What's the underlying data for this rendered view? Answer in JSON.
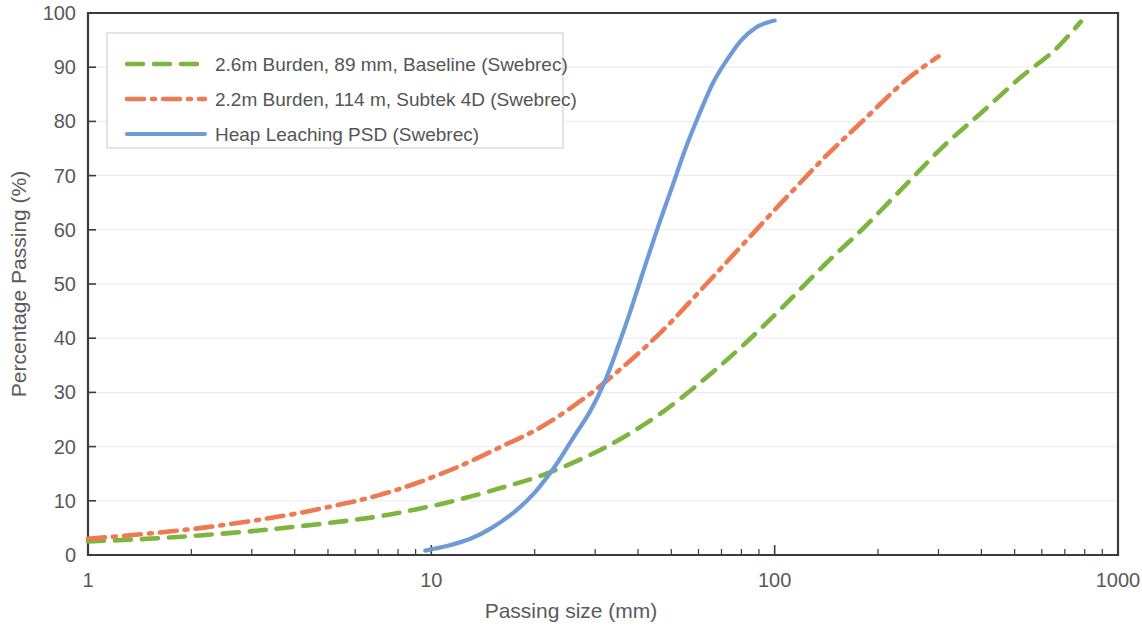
{
  "chart_data": {
    "type": "line",
    "title": "",
    "xlabel": "Passing size (mm)",
    "ylabel": "Percentage Passing (%)",
    "xscale": "log",
    "xlim": [
      1,
      1000
    ],
    "ylim": [
      0,
      100
    ],
    "xticks": [
      1,
      10,
      100,
      1000
    ],
    "xtick_labels": [
      "1",
      "10",
      "100",
      "1000"
    ],
    "yticks": [
      0,
      10,
      20,
      30,
      40,
      50,
      60,
      70,
      80,
      90,
      100
    ],
    "ytick_labels": [
      "0",
      "10",
      "20",
      "30",
      "40",
      "50",
      "60",
      "70",
      "80",
      "90",
      "100"
    ],
    "grid": "horizontal-faint",
    "legend_position": "upper-left",
    "series": [
      {
        "name": "2.6m Burden, 89 mm, Baseline (Swebrec)",
        "color": "#7EB53F",
        "style": "dashed",
        "dasharray": "16 11",
        "width": 4.6,
        "x": [
          1,
          1.3,
          1.7,
          2.2,
          3,
          4,
          5.5,
          7,
          9,
          12,
          16,
          21,
          28,
          36,
          47,
          62,
          80,
          105,
          140,
          180,
          240,
          310,
          400,
          520,
          650,
          780
        ],
        "y": [
          2.5,
          2.8,
          3.2,
          3.7,
          4.4,
          5.2,
          6.2,
          7.1,
          8.4,
          10.2,
          12.4,
          14.7,
          18.0,
          21.6,
          26.3,
          32.3,
          38.4,
          45.6,
          53.6,
          60.1,
          68.2,
          75.4,
          81.6,
          88.1,
          93.0,
          98.4
        ]
      },
      {
        "name": "2.2m Burden, 114 m, Subtek 4D (Swebrec)",
        "color": "#ED7A52",
        "style": "dashdot",
        "dasharray": "17 8 3 8",
        "width": 4.6,
        "x": [
          1,
          1.3,
          1.7,
          2.2,
          3,
          4,
          5.5,
          7,
          9,
          12,
          16,
          21,
          28,
          36,
          47,
          62,
          80,
          105,
          140,
          180,
          240,
          300
        ],
        "y": [
          3.0,
          3.6,
          4.3,
          5.1,
          6.3,
          7.6,
          9.4,
          11.0,
          13.2,
          16.3,
          20.0,
          23.7,
          29.0,
          34.6,
          41.3,
          49.4,
          57.0,
          65.1,
          73.4,
          80.0,
          87.5,
          92.0
        ]
      },
      {
        "name": "Heap Leaching PSD (Swebrec)",
        "color": "#6E9BD8",
        "style": "solid",
        "dasharray": "",
        "width": 4.2,
        "x": [
          9.6,
          11,
          13,
          15,
          17.5,
          20,
          23,
          26,
          29,
          32,
          35,
          38,
          42,
          46,
          50,
          55,
          60,
          66,
          72,
          80,
          88,
          96,
          100
        ],
        "y": [
          0.8,
          1.6,
          3.0,
          5.0,
          8.0,
          11.5,
          16.5,
          21.8,
          26.5,
          32.0,
          38.5,
          45.0,
          53.5,
          61.0,
          67.5,
          75.0,
          81.0,
          87.0,
          91.0,
          95.0,
          97.3,
          98.3,
          98.6
        ]
      }
    ],
    "annotations": []
  },
  "legend": {
    "entries": [
      {
        "label": "2.6m Burden, 89 mm, Baseline (Swebrec)"
      },
      {
        "label": "2.2m Burden, 114 m, Subtek 4D (Swebrec)"
      },
      {
        "label": "Heap Leaching PSD (Swebrec)"
      }
    ]
  }
}
